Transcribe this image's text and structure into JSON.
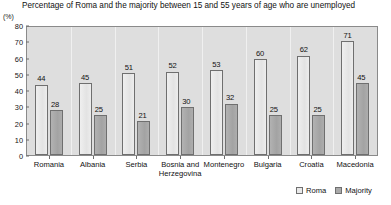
{
  "chart_data": {
    "type": "bar",
    "title": "Percentage of Roma  and the majority between 15 and 55 years of age who are unemployed",
    "xlabel": "",
    "ylabel": "(%)",
    "ylim": [
      0,
      80
    ],
    "yticks": [
      0,
      10,
      20,
      30,
      40,
      50,
      60,
      70,
      80
    ],
    "grid": false,
    "legend_position": "bottom-right",
    "categories": [
      "Romania",
      "Albania",
      "Serbia",
      "Bosnia and\nHerzegovina",
      "Montenegro",
      "Bulgaria",
      "Croatia",
      "Macedonia"
    ],
    "series": [
      {
        "name": "Roma",
        "color": "#e9e9e9",
        "values": [
          44,
          45,
          51,
          52,
          53,
          60,
          62,
          71
        ]
      },
      {
        "name": "Majority",
        "color": "#a9a9a9",
        "values": [
          28,
          25,
          21,
          30,
          32,
          25,
          25,
          45
        ]
      }
    ]
  },
  "legend": {
    "items": [
      {
        "label": "Roma"
      },
      {
        "label": "Majority"
      }
    ]
  }
}
